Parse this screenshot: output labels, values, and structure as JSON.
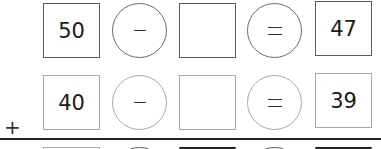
{
  "worksheet": {
    "rows": [
      {
        "minuend": "50",
        "operator": "−",
        "blank": "",
        "equals": "=",
        "result": "47"
      },
      {
        "minuend": "40",
        "operator": "−",
        "blank": "",
        "equals": "=",
        "result": "39"
      },
      {
        "minuend": "",
        "operator": "",
        "blank": "",
        "equals": "",
        "result": ""
      }
    ],
    "addition_sign": "+",
    "colors": {
      "row1_border": "#5a5a5a",
      "row2_border": "#a8a8a8",
      "rule": "#222222",
      "text": "#1a1a1a"
    }
  }
}
